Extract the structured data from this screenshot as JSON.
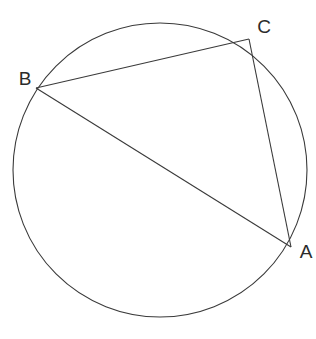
{
  "figure": {
    "kind": "circle-with-inscribed-triangle",
    "background_color": "#ffffff",
    "stroke_color": "#3a3a3a",
    "label_color": "#2b2b2b",
    "stroke_width": 1.1,
    "canvas": {
      "width": 316,
      "height": 339
    }
  },
  "circle": {
    "name": "circumcircle",
    "center_x": 160,
    "center_y": 170,
    "radius": 147
  },
  "points": [
    {
      "id": "A",
      "label": "A",
      "x": 291,
      "y": 247,
      "label_x": 306,
      "label_y": 253
    },
    {
      "id": "B",
      "label": "B",
      "x": 36,
      "y": 88,
      "label_x": 25,
      "label_y": 80
    },
    {
      "id": "C",
      "label": "C",
      "x": 249,
      "y": 39,
      "label_x": 264,
      "label_y": 28
    }
  ],
  "segments": [
    {
      "id": "BC",
      "name": "chord-bc",
      "from": "B",
      "to": "C"
    },
    {
      "id": "CA",
      "name": "chord-ca",
      "from": "C",
      "to": "A"
    },
    {
      "id": "BA",
      "name": "chord-ba",
      "from": "B",
      "to": "A"
    }
  ],
  "chart_data": {
    "type": "scatter",
    "x": [
      291,
      36,
      249
    ],
    "y": [
      247,
      88,
      39
    ],
    "labels": [
      "A",
      "B",
      "C"
    ]
  }
}
